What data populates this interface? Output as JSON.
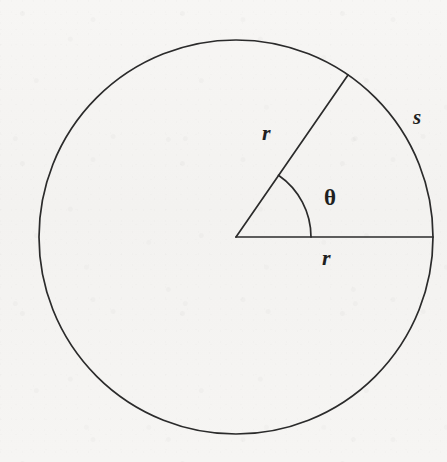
{
  "figure": {
    "kind": "circle-sector-diagram",
    "canvas": {
      "width": 447,
      "height": 462
    },
    "background_color": "#f6f5f3",
    "stroke_color": "#2b2b2b",
    "stroke_width": 1.7,
    "circle": {
      "center_x": 236,
      "center_y": 237,
      "radius": 197
    },
    "angle_arc": {
      "radius": 75,
      "start_angle_deg": 0,
      "end_angle_deg": 55.5
    },
    "radii": [
      {
        "name": "horizontal-radius",
        "from_x": 236,
        "from_y": 237,
        "to_x": 433,
        "to_y": 237,
        "angle_deg": 0
      },
      {
        "name": "angled-radius",
        "from_x": 236,
        "from_y": 237,
        "to_x": 348,
        "to_y": 75,
        "angle_deg": 55.5
      }
    ],
    "labels": {
      "radius_upper": "r",
      "central_angle": "θ",
      "arc_length": "s",
      "radius_lower": "r"
    }
  }
}
